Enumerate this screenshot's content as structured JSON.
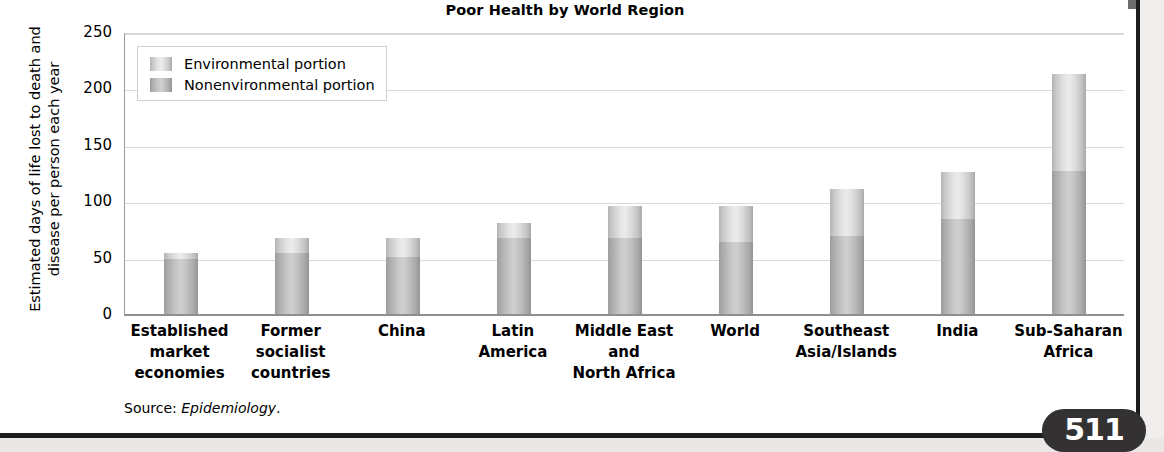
{
  "page": {
    "page_number": "511"
  },
  "source_note": {
    "prefix": "Source: ",
    "publication": "Epidemiology",
    "suffix": "."
  },
  "legend": {
    "items": [
      {
        "label": "Environmental portion",
        "key": "environmental",
        "color": "#e0e0e0"
      },
      {
        "label": "Nonenvironmental portion",
        "key": "nonenvironmental",
        "color": "#c4c4c4"
      }
    ]
  },
  "chart_data": {
    "type": "bar",
    "subtype": "stacked-vertical",
    "title": "Poor Health by World Region",
    "xlabel": "",
    "ylabel": "Estimated days of life lost to death and disease per person each year",
    "ylim": [
      0,
      250
    ],
    "yticks": [
      0,
      50,
      100,
      150,
      200,
      250
    ],
    "ytick_labels": [
      "0",
      "50",
      "100",
      "150",
      "200",
      "250"
    ],
    "grid": true,
    "legend_position": "upper-left-inside",
    "categories": [
      "Established market economies",
      "Former socialist countries",
      "China",
      "Latin America",
      "Middle East and North Africa",
      "World",
      "Southeast Asia/Islands",
      "India",
      "Sub-Saharan Africa"
    ],
    "category_lines": [
      [
        "Established",
        "market",
        "economies"
      ],
      [
        "Former",
        "socialist",
        "countries"
      ],
      [
        "China"
      ],
      [
        "Latin",
        "America"
      ],
      [
        "Middle East",
        "and",
        "North Africa"
      ],
      [
        "World"
      ],
      [
        "Southeast",
        "Asia/Islands"
      ],
      [
        "India"
      ],
      [
        "Sub-Saharan",
        "Africa"
      ]
    ],
    "series": [
      {
        "name": "Nonenvironmental portion",
        "key": "nonenvironmental",
        "values": [
          50,
          55,
          51,
          68,
          68,
          65,
          70,
          85,
          128
        ]
      },
      {
        "name": "Environmental portion",
        "key": "environmental",
        "values": [
          5,
          13,
          17,
          14,
          29,
          32,
          42,
          42,
          86
        ]
      }
    ],
    "totals": [
      55,
      68,
      68,
      82,
      97,
      97,
      112,
      127,
      214
    ]
  }
}
